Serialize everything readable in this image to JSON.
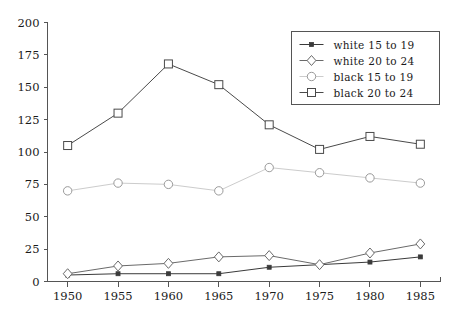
{
  "chart_data": {
    "type": "line",
    "title": "",
    "xlabel": "",
    "ylabel": "",
    "x": [
      1950,
      1955,
      1960,
      1965,
      1970,
      1975,
      1980,
      1985
    ],
    "categories": [
      "1950",
      "1955",
      "1960",
      "1965",
      "1970",
      "1975",
      "1980",
      "1985"
    ],
    "xlim": [
      1948,
      1987
    ],
    "ylim": [
      0,
      200
    ],
    "ytick_labels": [
      "0",
      "25",
      "50",
      "75",
      "100",
      "125",
      "150",
      "175",
      "200"
    ],
    "yticks": [
      0,
      25,
      50,
      75,
      100,
      125,
      150,
      175,
      200
    ],
    "grid": false,
    "legend_position": "upper right",
    "series": [
      {
        "name": "white 15 to 19",
        "marker": "filled-square",
        "color": "#3a3a3a",
        "values": [
          5,
          6,
          6,
          6,
          11,
          13,
          15,
          19
        ]
      },
      {
        "name": "white 20 to 24",
        "marker": "diamond",
        "color": "#6a6a6a",
        "values": [
          6,
          12,
          14,
          19,
          20,
          13,
          22,
          29
        ]
      },
      {
        "name": "black 15 to 19",
        "marker": "circle",
        "color": "#cccccc",
        "values": [
          70,
          76,
          75,
          70,
          88,
          84,
          80,
          76
        ]
      },
      {
        "name": "black 20 to 24",
        "marker": "open-square",
        "color": "#4a4a4a",
        "values": [
          105,
          130,
          168,
          152,
          121,
          102,
          112,
          106
        ]
      }
    ]
  },
  "legend": {
    "entries": [
      {
        "label": "white 15 to 19"
      },
      {
        "label": "white 20 to 24"
      },
      {
        "label": "black 15 to 19"
      },
      {
        "label": "black 20 to 24"
      }
    ]
  }
}
